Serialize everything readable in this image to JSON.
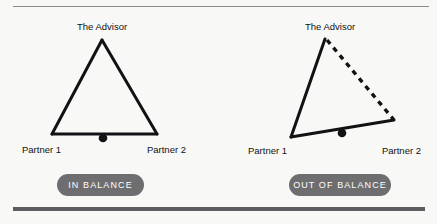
{
  "canvas": {
    "width": 437,
    "height": 224,
    "background": "#f8f8f6"
  },
  "rules": {
    "top": {
      "color": "#8d8d90",
      "thickness": 1
    },
    "bottom": {
      "color": "#5d5d5f",
      "thickness": 4
    }
  },
  "colors": {
    "stroke": "#111214",
    "pill_background": "#6e6e70",
    "pill_text": "#ffffff",
    "label_text": "#111214"
  },
  "diagrams": [
    {
      "id": "in-balance",
      "state_label": "IN BALANCE",
      "apex_label": "The Advisor",
      "left_label": "Partner 1",
      "right_label": "Partner 2",
      "shape": {
        "apex": [
          102,
          40
        ],
        "base_left": [
          52,
          134
        ],
        "base_right": [
          157,
          134
        ],
        "fulcrum": [
          103,
          138
        ],
        "left_edge_style": "solid",
        "right_edge_style": "solid",
        "base_style": "solid"
      }
    },
    {
      "id": "out-of-balance",
      "state_label": "OUT OF BALANCE",
      "apex_label": "The Advisor",
      "left_label": "Partner 1",
      "right_label": "Partner 2",
      "shape": {
        "apex": [
          325,
          39
        ],
        "base_left": [
          291,
          137
        ],
        "base_right": [
          394,
          120
        ],
        "fulcrum": [
          342,
          133
        ],
        "left_edge_style": "solid",
        "right_edge_style": "dashed",
        "base_style": "solid"
      }
    }
  ],
  "label_positions": {
    "left_advisor": {
      "x": 102,
      "y": 22
    },
    "left_partner1": {
      "x": 22,
      "y": 145
    },
    "left_partner2": {
      "x": 186,
      "y": 145
    },
    "right_advisor": {
      "x": 330,
      "y": 22
    },
    "right_partner1": {
      "x": 248,
      "y": 146
    },
    "right_partner2": {
      "x": 421,
      "y": 146
    }
  }
}
